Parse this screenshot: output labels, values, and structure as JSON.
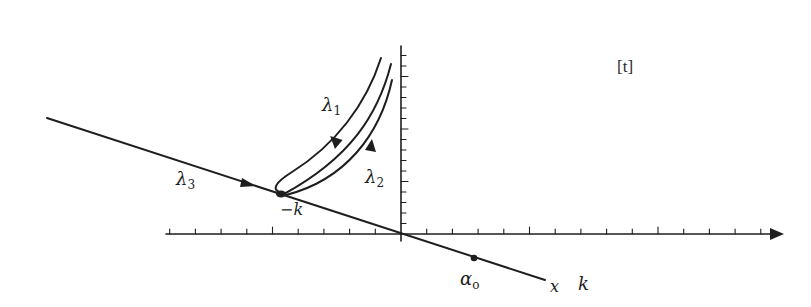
{
  "figure": {
    "panel_tag": "[t]",
    "colors": {
      "stroke": "#1e1e1e",
      "background": "#ffffff"
    },
    "labels": {
      "lambda1": {
        "base": "λ",
        "sub": "1"
      },
      "lambda2": {
        "base": "λ",
        "sub": "2"
      },
      "lambda3": {
        "base": "λ",
        "sub": "3"
      },
      "critical_point": "−k",
      "alpha0": {
        "base": "α",
        "sub": "o"
      },
      "x_axis_line": "x",
      "k_axis": "k"
    },
    "axes": {
      "horizontal": {
        "from": [
          166,
          234
        ],
        "to": [
          783,
          234
        ],
        "arrow": true,
        "tick_spacing_px": 25.7
      },
      "vertical": {
        "from": [
          401,
          46
        ],
        "to": [
          401,
          240
        ],
        "tick_spacing_px": 10.5
      }
    },
    "diagonal_line": {
      "from": [
        47,
        118
      ],
      "to": [
        545,
        280
      ]
    },
    "points": {
      "critical_point": [
        280,
        194
      ],
      "alpha0": [
        474,
        258
      ]
    },
    "curves": [
      "lambda1-outer-loop",
      "middle-trajectory",
      "lambda2-inner"
    ]
  }
}
